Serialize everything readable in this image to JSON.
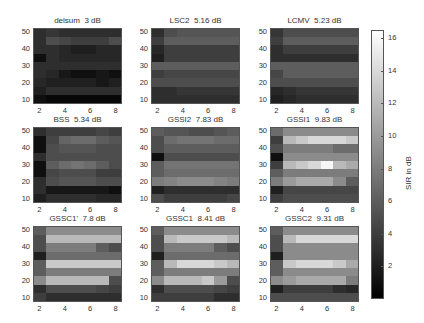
{
  "chart_data": {
    "type": "heatmap",
    "colormap": "gray",
    "clim": [
      0,
      16.5
    ],
    "colorbar": {
      "label": "SIR in dB",
      "ticks": [
        2,
        4,
        6,
        8,
        10,
        12,
        14,
        16
      ]
    },
    "x": [
      2,
      3,
      4,
      5,
      6,
      7,
      8
    ],
    "y": [
      10,
      15,
      20,
      25,
      30,
      35,
      40,
      45,
      50
    ],
    "xticks": [
      2,
      4,
      6,
      8
    ],
    "yticks": [
      10,
      20,
      30,
      40,
      50
    ],
    "panels": [
      {
        "title": "delsum  3 dB",
        "values": [
          [
            1,
            0.5,
            0.5,
            0.5,
            0.5,
            0.5,
            0.5
          ],
          [
            2,
            3,
            3,
            3,
            3,
            3,
            3
          ],
          [
            2.5,
            2,
            2,
            2,
            2,
            1.5,
            2
          ],
          [
            3,
            2.5,
            1.5,
            1,
            1,
            1.5,
            1
          ],
          [
            3,
            3,
            3,
            3,
            3,
            3,
            3
          ],
          [
            1,
            3,
            2.5,
            2.5,
            2.5,
            2.5,
            2.5
          ],
          [
            3,
            3,
            2.5,
            2,
            2,
            2.5,
            2.5
          ],
          [
            3,
            5,
            4.5,
            4,
            4,
            4,
            5
          ],
          [
            3,
            3.5,
            3,
            3,
            3,
            3,
            3
          ]
        ]
      },
      {
        "title": "LSC2  5.16 dB",
        "values": [
          [
            3,
            3,
            3,
            3,
            3,
            3,
            3
          ],
          [
            3,
            3,
            3.5,
            3.5,
            3.5,
            3.5,
            3.5
          ],
          [
            5,
            5,
            5,
            5,
            5,
            5,
            5
          ],
          [
            4,
            4.5,
            4.5,
            4.5,
            4.5,
            4.5,
            4.5
          ],
          [
            6,
            6,
            6,
            6,
            6,
            6,
            6
          ],
          [
            2,
            4,
            4,
            4,
            4,
            4,
            4
          ],
          [
            2.5,
            4,
            4,
            4,
            4,
            4,
            4
          ],
          [
            4,
            6,
            6,
            6,
            6,
            6,
            6
          ],
          [
            3,
            5,
            5.5,
            5.5,
            5.5,
            5.5,
            5.5
          ]
        ]
      },
      {
        "title": "LCMV  5.23 dB",
        "values": [
          [
            2,
            2.5,
            3,
            3,
            3,
            3,
            3
          ],
          [
            2.5,
            3,
            3.5,
            3.5,
            3.5,
            3.5,
            3.5
          ],
          [
            5,
            5,
            5,
            5,
            5,
            5,
            5
          ],
          [
            4.5,
            6,
            6,
            6,
            6,
            6,
            6
          ],
          [
            6,
            6,
            6,
            6,
            6,
            6,
            6
          ],
          [
            3,
            3,
            3,
            3,
            3,
            3,
            3
          ],
          [
            3,
            4,
            4,
            4,
            4,
            4,
            4
          ],
          [
            4,
            6,
            6,
            6,
            6,
            6,
            6
          ],
          [
            3.5,
            5,
            5,
            5,
            5,
            5,
            5
          ]
        ]
      },
      {
        "title": "BSS  5.34 dB",
        "values": [
          [
            2,
            3,
            3,
            3,
            3,
            2.5,
            2.5
          ],
          [
            3,
            1.5,
            1.5,
            1.5,
            1.5,
            1.5,
            1
          ],
          [
            3,
            5,
            5.5,
            5.5,
            5.5,
            5,
            5
          ],
          [
            1,
            4.5,
            5,
            5,
            5,
            4,
            4
          ],
          [
            1,
            6,
            7,
            7.5,
            7,
            6,
            5
          ],
          [
            3,
            5,
            5,
            5,
            5,
            5,
            5
          ],
          [
            1,
            5,
            5.5,
            5.5,
            5.5,
            5,
            5
          ],
          [
            1,
            4.5,
            6.5,
            7,
            7,
            6,
            5.5
          ],
          [
            3,
            4,
            4,
            4,
            4,
            4.5,
            4
          ]
        ]
      },
      {
        "title": "GSSI2  7.83 dB",
        "values": [
          [
            5,
            4,
            4,
            4,
            4,
            4,
            4.5
          ],
          [
            2,
            3,
            3,
            3,
            3,
            3,
            3
          ],
          [
            8,
            8.5,
            9,
            9,
            9,
            8.5,
            8
          ],
          [
            6,
            7,
            7,
            7,
            7,
            7,
            7
          ],
          [
            6,
            7.5,
            7.5,
            7.5,
            7.5,
            7.5,
            7.5
          ],
          [
            1,
            5,
            5,
            5,
            5,
            5,
            5
          ],
          [
            5,
            6,
            6,
            6,
            6,
            6,
            6
          ],
          [
            5,
            7,
            7.5,
            7.5,
            7.5,
            7,
            7
          ],
          [
            6,
            5.5,
            5.5,
            5,
            5,
            5.5,
            6
          ]
        ]
      },
      {
        "title": "GSSI1  9.83 dB",
        "values": [
          [
            4,
            5,
            5,
            5,
            5,
            5,
            5
          ],
          [
            2,
            4.5,
            4.5,
            4.5,
            4.5,
            4.5,
            4.5
          ],
          [
            8,
            10,
            11,
            11,
            11,
            9,
            6
          ],
          [
            6,
            8,
            8,
            8,
            8,
            8,
            8
          ],
          [
            4,
            12,
            13,
            14,
            16,
            12,
            11
          ],
          [
            1,
            9,
            9,
            9,
            9,
            9,
            9
          ],
          [
            5,
            8,
            8,
            8,
            8,
            7,
            7
          ],
          [
            4,
            12,
            13,
            14,
            14,
            14,
            13
          ],
          [
            7,
            9,
            9,
            9,
            9,
            9,
            9
          ]
        ]
      },
      {
        "title": "GSSC1'  7.8 dB",
        "values": [
          [
            4,
            3,
            3,
            3,
            3,
            3,
            3
          ],
          [
            3,
            5,
            5,
            5,
            5,
            4.5,
            4
          ],
          [
            9,
            12,
            12,
            12,
            12,
            12,
            5
          ],
          [
            6,
            8,
            8,
            8,
            8,
            8,
            8
          ],
          [
            6,
            13,
            13,
            13,
            13,
            13,
            13
          ],
          [
            2,
            7,
            7,
            7,
            7,
            7,
            7
          ],
          [
            5,
            8,
            8,
            8,
            8,
            6,
            5
          ],
          [
            5,
            12,
            12,
            12,
            12,
            12,
            12
          ],
          [
            6,
            9,
            9,
            9,
            9,
            9,
            9
          ]
        ]
      },
      {
        "title": "GSSC1  8.41 dB",
        "values": [
          [
            4,
            4,
            4,
            4,
            4,
            3,
            3
          ],
          [
            3,
            5,
            5,
            5,
            5,
            4.5,
            4
          ],
          [
            9,
            12,
            12,
            12,
            13,
            10,
            5
          ],
          [
            6,
            8,
            8,
            8,
            8,
            8,
            8
          ],
          [
            6,
            12,
            14,
            14,
            14,
            13,
            12
          ],
          [
            2,
            7,
            7,
            7,
            7,
            7,
            7
          ],
          [
            5,
            8,
            8,
            8,
            8,
            6,
            5
          ],
          [
            5,
            12,
            13,
            13,
            13,
            13,
            12
          ],
          [
            6,
            9,
            9,
            9,
            9,
            9,
            9
          ]
        ]
      },
      {
        "title": "GSSC2  9.31 dB",
        "values": [
          [
            5,
            5,
            5,
            5,
            5,
            5,
            5
          ],
          [
            2,
            4,
            4,
            4,
            4,
            3,
            2.5
          ],
          [
            9,
            10,
            11,
            11,
            11,
            11,
            8
          ],
          [
            6,
            9,
            9,
            9,
            9,
            9,
            9
          ],
          [
            6,
            13,
            14,
            14,
            14,
            13,
            11
          ],
          [
            2,
            9,
            9,
            9,
            9,
            9,
            9
          ],
          [
            5,
            9,
            9,
            9,
            9,
            9,
            9
          ],
          [
            5,
            12,
            14,
            14,
            14,
            14,
            14
          ],
          [
            6,
            9,
            9,
            9,
            9,
            9,
            9
          ]
        ]
      }
    ]
  }
}
